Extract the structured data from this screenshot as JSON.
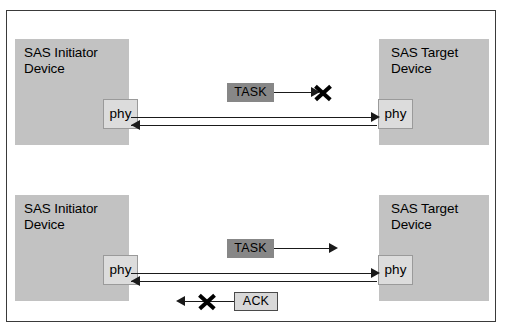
{
  "figure": {
    "caption_remnant": "",
    "background_color": "#ffffff",
    "frame_color": "#3a3a3a",
    "device_fill": "#c2c2c2",
    "phy_fill": "#dcdcdc",
    "task_fill": "#878787",
    "ack_fill": "#d8d8d8",
    "line_color": "#1a1a1a"
  },
  "panels": [
    {
      "id": "top",
      "initiator": {
        "label": "SAS Initiator\nDevice",
        "phy_label": "phy"
      },
      "target": {
        "label": "SAS Target\nDevice",
        "phy_label": "phy"
      },
      "messages": [
        {
          "label": "TASK",
          "direction": "right",
          "blocked": true,
          "style": "task"
        }
      ],
      "links": [
        {
          "direction": "right"
        },
        {
          "direction": "left"
        }
      ]
    },
    {
      "id": "bottom",
      "initiator": {
        "label": "SAS Initiator\nDevice",
        "phy_label": "phy"
      },
      "target": {
        "label": "SAS Target\nDevice",
        "phy_label": "phy"
      },
      "messages": [
        {
          "label": "TASK",
          "direction": "right",
          "blocked": false,
          "style": "task"
        },
        {
          "label": "ACK",
          "direction": "left",
          "blocked": true,
          "style": "ack"
        }
      ],
      "links": [
        {
          "direction": "right"
        },
        {
          "direction": "left"
        }
      ]
    }
  ]
}
